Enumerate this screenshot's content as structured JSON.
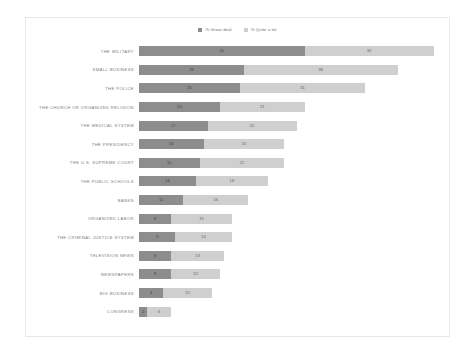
{
  "legend": {
    "position": "top-center",
    "items": [
      {
        "label": "% Great deal",
        "color": "#8d8d8d",
        "key": "great_deal"
      },
      {
        "label": "% Quite a lot",
        "color": "#cfcfcf",
        "key": "quite_a_lot"
      }
    ]
  },
  "chart_data": {
    "type": "bar",
    "orientation": "horizontal",
    "stacked": true,
    "title": "",
    "subtitle": "",
    "xlabel": "",
    "ylabel": "",
    "grid": false,
    "axis_visible": false,
    "xlim": [
      0,
      75
    ],
    "legend_position": "top-center",
    "categories": [
      "THE MILITARY",
      "SMALL BUSINESS",
      "THE POLICE",
      "THE CHURCH OR ORGANIZED RELIGION",
      "THE MEDICAL SYSTEM",
      "THE PRESIDENCY",
      "THE U.S. SUPREME COURT",
      "THE PUBLIC SCHOOLS",
      "BANKS",
      "ORGANIZED LABOR",
      "THE CRIMINAL JUSTICE SYSTEM",
      "TELEVISION NEWS",
      "NEWSPAPERS",
      "BIG BUSINESS",
      "CONGRESS"
    ],
    "series": [
      {
        "name": "% Great deal",
        "color": "#8d8d8d",
        "values": [
          41,
          26,
          25,
          20,
          17,
          16,
          15,
          14,
          11,
          8,
          9,
          8,
          8,
          6,
          2
        ]
      },
      {
        "name": "% Quite a lot",
        "color": "#cfcfcf",
        "values": [
          32,
          38,
          31,
          21,
          22,
          20,
          21,
          18,
          16,
          15,
          14,
          13,
          12,
          12,
          6
        ]
      }
    ],
    "rows": [
      {
        "category": "THE MILITARY",
        "great_deal": 41,
        "quite_a_lot": 32,
        "total": 73
      },
      {
        "category": "SMALL BUSINESS",
        "great_deal": 26,
        "quite_a_lot": 38,
        "total": 64
      },
      {
        "category": "THE POLICE",
        "great_deal": 25,
        "quite_a_lot": 31,
        "total": 56
      },
      {
        "category": "THE CHURCH OR ORGANIZED RELIGION",
        "great_deal": 20,
        "quite_a_lot": 21,
        "total": 41
      },
      {
        "category": "THE MEDICAL SYSTEM",
        "great_deal": 17,
        "quite_a_lot": 22,
        "total": 39
      },
      {
        "category": "THE PRESIDENCY",
        "great_deal": 16,
        "quite_a_lot": 20,
        "total": 36
      },
      {
        "category": "THE U.S. SUPREME COURT",
        "great_deal": 15,
        "quite_a_lot": 21,
        "total": 36
      },
      {
        "category": "THE PUBLIC SCHOOLS",
        "great_deal": 14,
        "quite_a_lot": 18,
        "total": 32
      },
      {
        "category": "BANKS",
        "great_deal": 11,
        "quite_a_lot": 16,
        "total": 27
      },
      {
        "category": "ORGANIZED LABOR",
        "great_deal": 8,
        "quite_a_lot": 15,
        "total": 23
      },
      {
        "category": "THE CRIMINAL JUSTICE SYSTEM",
        "great_deal": 9,
        "quite_a_lot": 14,
        "total": 23
      },
      {
        "category": "TELEVISION NEWS",
        "great_deal": 8,
        "quite_a_lot": 13,
        "total": 21
      },
      {
        "category": "NEWSPAPERS",
        "great_deal": 8,
        "quite_a_lot": 12,
        "total": 20
      },
      {
        "category": "BIG BUSINESS",
        "great_deal": 6,
        "quite_a_lot": 12,
        "total": 18
      },
      {
        "category": "CONGRESS",
        "great_deal": 2,
        "quite_a_lot": 6,
        "total": 8
      }
    ]
  },
  "style": {
    "great_deal_color": "#8d8d8d",
    "quite_a_lot_color": "#cfcfcf",
    "card_border_color": "#e8e8e8",
    "label_color": "#7b7b7b",
    "background": "#ffffff"
  }
}
